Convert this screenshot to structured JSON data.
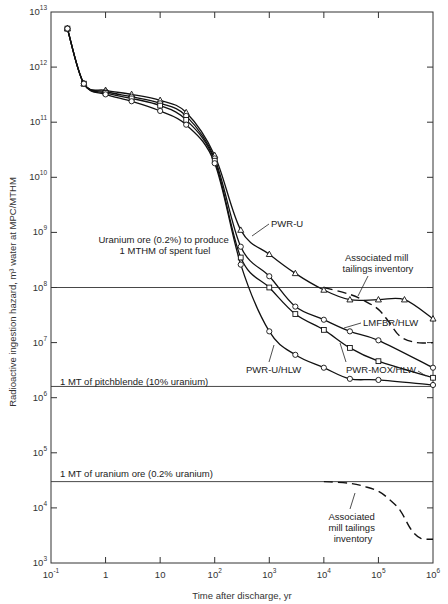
{
  "chart_data": {
    "type": "line",
    "title": "",
    "xlabel": "Time after discharge, yr",
    "ylabel": "Radioactive ingestion hazard, m³ water at MPC/MTHM",
    "xscale": "log",
    "yscale": "log",
    "xlim": [
      0.1,
      1000000
    ],
    "ylim": [
      1000,
      10000000000000
    ],
    "grid": false,
    "x_ticks": [
      {
        "base": "10",
        "exp": "-1",
        "value": 0.1
      },
      {
        "base": "1",
        "exp": "",
        "value": 1
      },
      {
        "base": "10",
        "exp": "",
        "value": 10
      },
      {
        "base": "10",
        "exp": "2",
        "value": 100
      },
      {
        "base": "10",
        "exp": "3",
        "value": 1000
      },
      {
        "base": "10",
        "exp": "4",
        "value": 10000
      },
      {
        "base": "10",
        "exp": "5",
        "value": 100000
      },
      {
        "base": "10",
        "exp": "6",
        "value": 1000000
      }
    ],
    "y_ticks": [
      {
        "base": "10",
        "exp": "3",
        "value": 1000.0
      },
      {
        "base": "10",
        "exp": "4",
        "value": 10000.0
      },
      {
        "base": "10",
        "exp": "5",
        "value": 100000.0
      },
      {
        "base": "10",
        "exp": "6",
        "value": 1000000.0
      },
      {
        "base": "10",
        "exp": "7",
        "value": 10000000.0
      },
      {
        "base": "10",
        "exp": "8",
        "value": 100000000.0
      },
      {
        "base": "10",
        "exp": "9",
        "value": 1000000000.0
      },
      {
        "base": "10",
        "exp": "10",
        "value": 10000000000.0
      },
      {
        "base": "10",
        "exp": "11",
        "value": 100000000000.0
      },
      {
        "base": "10",
        "exp": "12",
        "value": 1000000000000.0
      },
      {
        "base": "10",
        "exp": "13",
        "value": 10000000000000.0
      }
    ],
    "series": [
      {
        "name": "PWR-U",
        "marker": "triangle",
        "style": "solid",
        "x": [
          0.2,
          0.4,
          1,
          3,
          10,
          30,
          100,
          300,
          1000,
          3000,
          10000,
          30000,
          100000,
          300000,
          1000000
        ],
        "y": [
          5000000000000.0,
          500000000000.0,
          380000000000.0,
          320000000000.0,
          250000000000.0,
          150000000000.0,
          25000000000.0,
          1100000000.0,
          400000000.0,
          180000000.0,
          90000000.0,
          60000000.0,
          60000000.0,
          60000000.0,
          27000000.0
        ]
      },
      {
        "name": "LMFBR/HLW",
        "marker": "circle",
        "style": "solid",
        "x": [
          0.2,
          0.4,
          1,
          3,
          10,
          30,
          100,
          300,
          1000,
          3000,
          10000,
          30000,
          100000,
          1000000
        ],
        "y": [
          5000000000000.0,
          500000000000.0,
          360000000000.0,
          290000000000.0,
          220000000000.0,
          130000000000.0,
          22000000000.0,
          550000000.0,
          160000000.0,
          45000000.0,
          26000000.0,
          16000000.0,
          11000000.0,
          3500000.0
        ]
      },
      {
        "name": "PWR-MOX/HLW",
        "marker": "square",
        "style": "solid",
        "x": [
          0.2,
          0.4,
          1,
          3,
          10,
          30,
          100,
          300,
          1000,
          3000,
          10000,
          30000,
          100000,
          1000000
        ],
        "y": [
          5000000000000.0,
          500000000000.0,
          340000000000.0,
          270000000000.0,
          200000000000.0,
          110000000000.0,
          20000000000.0,
          350000000.0,
          100000000.0,
          33000000.0,
          17000000.0,
          8000000.0,
          4600000.0,
          2300000.0
        ]
      },
      {
        "name": "PWR-U/HLW",
        "marker": "circle",
        "style": "solid",
        "x": [
          0.2,
          0.4,
          1,
          3,
          10,
          30,
          100,
          300,
          1000,
          3000,
          10000,
          30000,
          100000,
          1000000
        ],
        "y": [
          5000000000000.0,
          500000000000.0,
          320000000000.0,
          240000000000.0,
          160000000000.0,
          90000000000.0,
          18000000000.0,
          260000000.0,
          16000000.0,
          6000000.0,
          3500000.0,
          2200000.0,
          2100000.0,
          1700000.0
        ]
      },
      {
        "name": "Associated mill tailings inventory (upper)",
        "marker": "none",
        "style": "dashed",
        "x": [
          10000,
          30000,
          60000,
          100000,
          150000,
          250000,
          500000,
          1000000
        ],
        "y": [
          100000000.0,
          75000000.0,
          55000000.0,
          40000000.0,
          25000000.0,
          13000000.0,
          10000000.0,
          10000000.0
        ]
      },
      {
        "name": "Associated mill tailings inventory (lower)",
        "marker": "none",
        "style": "dashed",
        "x": [
          10000,
          30000,
          60000,
          100000,
          150000,
          250000,
          400000,
          600000,
          1000000
        ],
        "y": [
          30000.0,
          28000.0,
          24000.0,
          20000.0,
          15000.0,
          9000.0,
          4000.0,
          2800.0,
          2700.0
        ]
      }
    ],
    "reference_lines": [
      {
        "label": "Uranium ore (0.2%) to produce 1 MTHM of spent fuel",
        "y": 100000000.0
      },
      {
        "label": "1 MT of pitchblende (10% uranium)",
        "y": 1600000.0
      },
      {
        "label": "1 MT of uranium ore (0.2% uranium)",
        "y": 30000.0
      }
    ],
    "annotations": [
      {
        "text": "PWR-U",
        "target_series": "PWR-U"
      },
      {
        "text": "Associated mill tailings inventory",
        "target_series": "Associated mill tailings inventory (upper)"
      },
      {
        "text": "LMFBR/HLW",
        "target_series": "LMFBR/HLW"
      },
      {
        "text": "PWR-U/HLW",
        "target_series": "PWR-U/HLW"
      },
      {
        "text": "PWR-MOX/HLW",
        "target_series": "PWR-MOX/HLW"
      },
      {
        "text": "Associated mill tailings inventory",
        "target_series": "Associated mill tailings inventory (lower)"
      }
    ]
  },
  "labels": {
    "ref_ore_line1": "Uranium ore (0.2%) to produce",
    "ref_ore_line2": "1 MTHM of spent fuel",
    "ref_pitchblende": "1 MT of pitchblende (10% uranium)",
    "ref_uranium_ore": "1 MT of uranium ore (0.2% uranium)",
    "pwr_u": "PWR-U",
    "tailings_upper_line1": "Associated mill",
    "tailings_upper_line2": "tailings inventory",
    "lmfbr_hlw": "LMFBR/HLW",
    "pwr_u_hlw": "PWR-U/HLW",
    "pwr_mox_hlw": "PWR-MOX/HLW",
    "tailings_lower_line1": "Associated",
    "tailings_lower_line2": "mill tailings",
    "tailings_lower_line3": "inventory",
    "xlabel": "Time after discharge, yr",
    "ylabel": "Radioactive ingestion hazard, m³ water at MPC/MTHM"
  }
}
